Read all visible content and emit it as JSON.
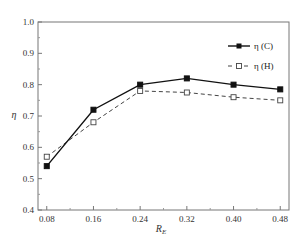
{
  "chart_data": {
    "type": "line",
    "title": "",
    "xlabel": "R_E",
    "ylabel": "η",
    "x": [
      0.08,
      0.16,
      0.24,
      0.32,
      0.4,
      0.48
    ],
    "x_tick_labels": [
      "0.08",
      "0.16",
      "0.24",
      "0.32",
      "0.40",
      "0.48"
    ],
    "y_tick_labels": [
      "0.4",
      "0.5",
      "0.6",
      "0.7",
      "0.8",
      "0.9",
      "1.0"
    ],
    "xlim": [
      0.065,
      0.495
    ],
    "ylim": [
      0.4,
      1.0
    ],
    "grid": false,
    "legend_position": "upper right",
    "series": [
      {
        "name": "η (C)",
        "values": [
          0.54,
          0.72,
          0.8,
          0.82,
          0.8,
          0.785
        ],
        "line_style": "solid",
        "marker": "filled-square",
        "color": "#111111"
      },
      {
        "name": "η (H)",
        "values": [
          0.57,
          0.68,
          0.78,
          0.775,
          0.76,
          0.75
        ],
        "line_style": "dashed",
        "marker": "hollow-square",
        "color": "#444444"
      }
    ]
  },
  "legend": {
    "items": [
      {
        "label": "η (C)"
      },
      {
        "label": "η (H)"
      }
    ]
  },
  "axes": {
    "xlabel_main": "R",
    "xlabel_sub": "E",
    "ylabel": "η"
  }
}
